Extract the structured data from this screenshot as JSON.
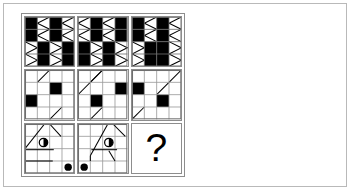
{
  "page": {
    "background_color": "#ffffff",
    "frame_color": "#b9b9b9",
    "width": 352,
    "height": 192
  },
  "matrix": {
    "rows": 3,
    "columns": 3,
    "border_color": "#8d8d8d",
    "cell_background": "#ffffff",
    "fill_color": "#000000",
    "grid_line_color": "#9a9a9a",
    "subgrid_size": 4,
    "missing_cell_label": "?",
    "missing_cell_position": "row-3-column-3",
    "cells": [
      {
        "id": "cell-r1c1",
        "row": 1,
        "column": 1,
        "style": "bold-grid",
        "grid_line_color": "#7a7a7a",
        "filled_squares": [
          [
            0,
            0
          ],
          [
            0,
            2
          ],
          [
            1,
            0
          ],
          [
            1,
            2
          ],
          [
            2,
            1
          ],
          [
            2,
            3
          ],
          [
            3,
            1
          ],
          [
            3,
            3
          ]
        ],
        "diagonal_marks": [
          {
            "cell": [
              0,
              1
            ],
            "type": "bowtie-left"
          },
          {
            "cell": [
              0,
              3
            ],
            "type": "bowtie-left"
          },
          {
            "cell": [
              1,
              1
            ],
            "type": "bowtie-left"
          },
          {
            "cell": [
              1,
              3
            ],
            "type": "bowtie-left"
          },
          {
            "cell": [
              2,
              0
            ],
            "type": "bowtie-right"
          },
          {
            "cell": [
              2,
              2
            ],
            "type": "bowtie-right"
          },
          {
            "cell": [
              3,
              0
            ],
            "type": "bowtie-right"
          },
          {
            "cell": [
              3,
              2
            ],
            "type": "bowtie-right"
          }
        ]
      },
      {
        "id": "cell-r1c2",
        "row": 1,
        "column": 2,
        "style": "bold-grid",
        "grid_line_color": "#7a7a7a",
        "filled_squares": [
          [
            0,
            1
          ],
          [
            0,
            3
          ],
          [
            1,
            1
          ],
          [
            1,
            3
          ],
          [
            2,
            0
          ],
          [
            2,
            2
          ],
          [
            3,
            0
          ],
          [
            3,
            2
          ]
        ],
        "diagonal_marks": [
          {
            "cell": [
              0,
              0
            ],
            "type": "bowtie-left"
          },
          {
            "cell": [
              0,
              2
            ],
            "type": "bowtie-left"
          },
          {
            "cell": [
              1,
              0
            ],
            "type": "bowtie-left"
          },
          {
            "cell": [
              1,
              2
            ],
            "type": "bowtie-left"
          },
          {
            "cell": [
              2,
              1
            ],
            "type": "bowtie-right"
          },
          {
            "cell": [
              2,
              3
            ],
            "type": "bowtie-right"
          },
          {
            "cell": [
              3,
              1
            ],
            "type": "bowtie-right"
          },
          {
            "cell": [
              3,
              3
            ],
            "type": "bowtie-right"
          }
        ]
      },
      {
        "id": "cell-r1c3",
        "row": 1,
        "column": 3,
        "style": "bold-grid",
        "grid_line_color": "#7a7a7a",
        "filled_squares": [
          [
            0,
            0
          ],
          [
            0,
            2
          ],
          [
            1,
            0
          ],
          [
            1,
            2
          ],
          [
            2,
            1
          ],
          [
            2,
            2
          ],
          [
            3,
            1
          ],
          [
            3,
            2
          ]
        ],
        "diagonal_marks": [
          {
            "cell": [
              0,
              1
            ],
            "type": "bowtie-left"
          },
          {
            "cell": [
              0,
              3
            ],
            "type": "bowtie-left"
          },
          {
            "cell": [
              1,
              1
            ],
            "type": "bowtie-left"
          },
          {
            "cell": [
              1,
              3
            ],
            "type": "bowtie-left"
          },
          {
            "cell": [
              2,
              0
            ],
            "type": "bowtie-right"
          },
          {
            "cell": [
              2,
              3
            ],
            "type": "bowtie-right"
          },
          {
            "cell": [
              3,
              0
            ],
            "type": "bowtie-right"
          },
          {
            "cell": [
              3,
              3
            ],
            "type": "bowtie-right"
          }
        ]
      },
      {
        "id": "cell-r2c1",
        "row": 2,
        "column": 1,
        "style": "light-grid",
        "grid_line_color": "#9a9a9a",
        "filled_squares": [
          [
            1,
            2
          ],
          [
            2,
            0
          ]
        ],
        "diagonal_lines": [
          {
            "from": [
              1.0,
              0.98
            ],
            "to": [
              2.0,
              0.02
            ],
            "weight": 1
          },
          {
            "from": [
              0.02,
              2.98
            ],
            "to": [
              0.98,
              2.02
            ],
            "weight": 1
          },
          {
            "from": [
              2.02,
              3.98
            ],
            "to": [
              2.98,
              3.02
            ],
            "weight": 1
          }
        ]
      },
      {
        "id": "cell-r2c2",
        "row": 2,
        "column": 2,
        "style": "light-grid",
        "grid_line_color": "#9a9a9a",
        "filled_squares": [
          [
            1,
            3
          ],
          [
            2,
            1
          ]
        ],
        "diagonal_lines": [
          {
            "from": [
              1.0,
              0.98
            ],
            "to": [
              2.0,
              0.02
            ],
            "weight": 1
          },
          {
            "from": [
              0.02,
              1.98
            ],
            "to": [
              1.98,
              0.02
            ],
            "weight": 1
          },
          {
            "from": [
              1.02,
              3.98
            ],
            "to": [
              1.98,
              3.02
            ],
            "weight": 1
          }
        ]
      },
      {
        "id": "cell-r2c3",
        "row": 2,
        "column": 3,
        "style": "light-grid",
        "grid_line_color": "#9a9a9a",
        "filled_squares": [
          [
            1,
            0
          ],
          [
            2,
            2
          ]
        ],
        "diagonal_lines": [
          {
            "from": [
              3.0,
              0.98
            ],
            "to": [
              4.0,
              0.02
            ],
            "weight": 1
          },
          {
            "from": [
              2.02,
              1.98
            ],
            "to": [
              2.98,
              1.02
            ],
            "weight": 1
          },
          {
            "from": [
              0.02,
              3.98
            ],
            "to": [
              0.98,
              3.02
            ],
            "weight": 1
          }
        ]
      },
      {
        "id": "cell-r3c1",
        "row": 3,
        "column": 1,
        "style": "light-grid",
        "grid_line_color": "#9a9a9a",
        "filled_squares": [],
        "diagonal_lines": [
          {
            "from": [
              0.0,
              2.0
            ],
            "to": [
              1.6,
              0.0
            ],
            "weight": 1
          },
          {
            "from": [
              2.0,
              0.0
            ],
            "to": [
              2.9,
              1.0
            ],
            "weight": 1
          },
          {
            "from": [
              0.0,
              2.0
            ],
            "to": [
              0.0,
              3.0
            ],
            "weight": 1
          },
          {
            "from": [
              0.0,
              3.0
            ],
            "to": [
              2.2,
              3.0
            ],
            "weight": 1
          },
          {
            "from": [
              0.05,
              2.05
            ],
            "to": [
              2.3,
              2.05
            ],
            "weight": 1
          }
        ],
        "shapes": [
          {
            "type": "half-circle",
            "glyph": "half-filled-circle",
            "at": [
              1.5,
              1.5
            ]
          },
          {
            "type": "filled-circle",
            "glyph": "solid-dot",
            "at": [
              3.5,
              3.5
            ]
          }
        ]
      },
      {
        "id": "cell-r3c2",
        "row": 3,
        "column": 2,
        "style": "light-grid",
        "grid_line_color": "#9a9a9a",
        "filled_squares": [],
        "diagonal_lines": [
          {
            "from": [
              1.0,
              2.6
            ],
            "to": [
              2.4,
              0.0
            ],
            "weight": 1
          },
          {
            "from": [
              3.0,
              0.0
            ],
            "to": [
              3.9,
              1.0
            ],
            "weight": 1
          },
          {
            "from": [
              1.0,
              2.6
            ],
            "to": [
              1.0,
              3.0
            ],
            "weight": 1
          },
          {
            "from": [
              1.05,
              2.05
            ],
            "to": [
              3.2,
              2.05
            ],
            "weight": 1
          },
          {
            "from": [
              2.5,
              2.1
            ],
            "to": [
              3.0,
              3.0
            ],
            "weight": 1
          }
        ],
        "shapes": [
          {
            "type": "half-circle",
            "glyph": "half-filled-circle",
            "at": [
              2.5,
              1.5
            ]
          },
          {
            "type": "filled-circle",
            "glyph": "solid-dot",
            "at": [
              0.5,
              3.5
            ]
          }
        ]
      },
      {
        "id": "cell-r3c3",
        "row": 3,
        "column": 3,
        "style": "question",
        "label": "?"
      }
    ]
  }
}
